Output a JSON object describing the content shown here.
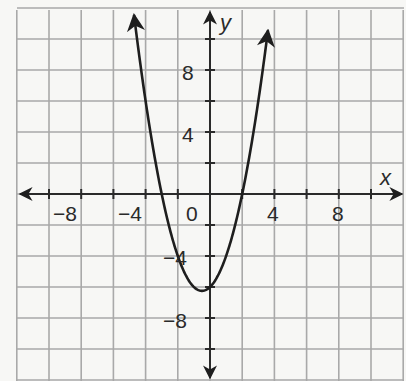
{
  "chart_data": {
    "type": "line",
    "title": "",
    "xlabel": "x",
    "ylabel": "y",
    "xlim": [
      -12,
      12
    ],
    "ylim": [
      -12,
      12
    ],
    "grid": true,
    "grid_step": 2,
    "x_ticks": [
      -8,
      -4,
      0,
      4,
      8
    ],
    "y_ticks": [
      8,
      4,
      -4,
      -8
    ],
    "x_tick_labels": [
      "−8",
      "−4",
      "0",
      "4",
      "8"
    ],
    "y_tick_labels": [
      "8",
      "4",
      "−4",
      "−8"
    ],
    "series": [
      {
        "name": "parabola",
        "equation": "y = x^2 + x - 6",
        "vertex": [
          -0.5,
          -6.25
        ],
        "x_intercepts": [
          -3,
          2
        ],
        "y_intercept": -6,
        "x": [
          -4.7,
          -4,
          -3,
          -2,
          -1,
          -0.5,
          0,
          1,
          2,
          3,
          3.6
        ],
        "y": [
          11.39,
          6,
          0,
          -4,
          -6,
          -6.25,
          -6,
          -4,
          0,
          6,
          10.56
        ],
        "arrows_at_ends": true
      }
    ]
  },
  "labels": {
    "x_axis": "x",
    "y_axis": "y",
    "origin": "0",
    "x_neg8": "−8",
    "x_neg4": "−4",
    "x_4": "4",
    "x_8": "8",
    "y_8": "8",
    "y_4": "4",
    "y_neg4": "−4",
    "y_neg8": "−8"
  },
  "colors": {
    "background": "#f7f7f5",
    "grid": "#a9a9a9",
    "axis": "#2a2a2a",
    "curve": "#1e1e1e"
  }
}
